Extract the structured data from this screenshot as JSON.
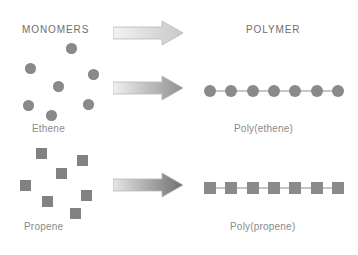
{
  "figure": {
    "type": "diagram",
    "background_color": "#ffffff",
    "monomer_color": "#8a8a8a",
    "chain_color": "#8d8d8d",
    "text_color": "#7d7d7d"
  },
  "headings": {
    "left": "MONOMERS",
    "right": "POLYMER"
  },
  "rows": [
    {
      "id": "ethene",
      "monomer_label": "Ethene",
      "polymer_label": "Poly(ethene)",
      "monomer_shape": "circle",
      "monomer_count": 7,
      "polymer_unit_count": 7,
      "monomer_positions": [
        {
          "x": 66,
          "y": 43
        },
        {
          "x": 25,
          "y": 63
        },
        {
          "x": 88,
          "y": 69
        },
        {
          "x": 53,
          "y": 81
        },
        {
          "x": 23,
          "y": 100
        },
        {
          "x": 83,
          "y": 99
        },
        {
          "x": 46,
          "y": 110
        }
      ],
      "chain": {
        "x": 210,
        "y": 83,
        "width": 128
      },
      "arrow": {
        "x": 113,
        "y": 75,
        "width": 70,
        "shade": "medium"
      }
    },
    {
      "id": "propene",
      "monomer_label": "Propene",
      "polymer_label": "Poly(propene)",
      "monomer_shape": "square",
      "monomer_count": 7,
      "polymer_unit_count": 7,
      "monomer_positions": [
        {
          "x": 36,
          "y": 148
        },
        {
          "x": 77,
          "y": 155
        },
        {
          "x": 56,
          "y": 168
        },
        {
          "x": 20,
          "y": 180
        },
        {
          "x": 81,
          "y": 190
        },
        {
          "x": 42,
          "y": 196
        },
        {
          "x": 70,
          "y": 208
        }
      ],
      "chain": {
        "x": 210,
        "y": 180,
        "width": 128
      },
      "arrow": {
        "x": 113,
        "y": 172,
        "width": 70,
        "shade": "dark"
      }
    }
  ],
  "top_arrow": {
    "x": 113,
    "y": 20,
    "width": 70,
    "shade": "light"
  },
  "arrow_shades": {
    "light": {
      "start": "#f2f2f2",
      "end": "#c9c9c9",
      "head": "#cfcfcf"
    },
    "medium": {
      "start": "#f0f0f0",
      "end": "#8f8f8f",
      "head": "#848484"
    },
    "dark": {
      "start": "#e6e6e6",
      "end": "#6f6f6f",
      "head": "#6b6b6b"
    }
  }
}
